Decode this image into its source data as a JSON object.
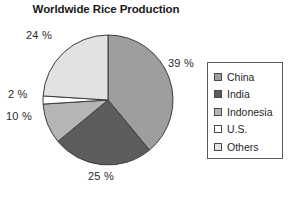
{
  "chart_data": {
    "type": "pie",
    "title": "Worldwide Rice Production",
    "xlabel": "",
    "ylabel": "",
    "legend_position": "right",
    "grid": false,
    "start_angle_deg": 0,
    "direction": "clockwise",
    "categories": [
      "China",
      "India",
      "Indonesia",
      "U.S.",
      "Others"
    ],
    "values": [
      39,
      25,
      10,
      2,
      24
    ],
    "value_unit": "%",
    "labels": [
      "39 %",
      "25 %",
      "10 %",
      "2 %",
      "24 %"
    ],
    "colors": [
      "#9e9e9e",
      "#5d5d5d",
      "#b5b5b5",
      "#ffffff",
      "#e2e2e2"
    ],
    "slice_outline_color": "#3c3c3c",
    "slices": [
      {
        "name": "China",
        "value": 39,
        "label": "39 %",
        "color": "#9e9e9e"
      },
      {
        "name": "India",
        "value": 25,
        "label": "25 %",
        "color": "#5d5d5d"
      },
      {
        "name": "Indonesia",
        "value": 10,
        "label": "10 %",
        "color": "#b5b5b5"
      },
      {
        "name": "U.S.",
        "value": 2,
        "label": "2 %",
        "color": "#ffffff"
      },
      {
        "name": "Others",
        "value": 24,
        "label": "24 %",
        "color": "#e2e2e2"
      }
    ]
  },
  "legend": {
    "items": [
      {
        "label": "China",
        "color": "#9e9e9e"
      },
      {
        "label": "India",
        "color": "#5d5d5d"
      },
      {
        "label": "Indonesia",
        "color": "#b5b5b5"
      },
      {
        "label": "U.S.",
        "color": "#ffffff"
      },
      {
        "label": "Others",
        "color": "#e2e2e2"
      }
    ]
  }
}
